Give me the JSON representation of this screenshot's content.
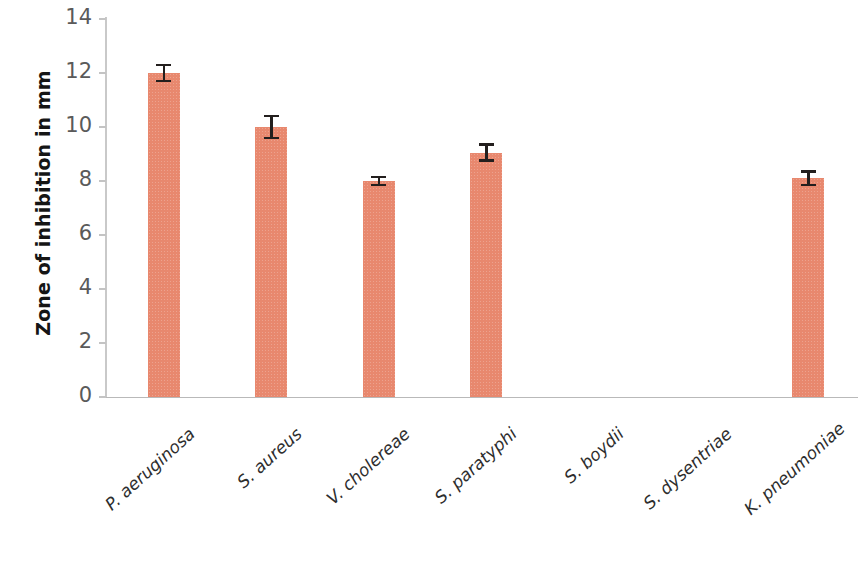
{
  "chart_data": {
    "type": "bar",
    "title": "",
    "subtitle": "",
    "xlabel": "",
    "ylabel": "Zone of inhibition in mm",
    "ylim": [
      0,
      14
    ],
    "ytick_values": [
      0,
      2,
      4,
      6,
      8,
      10,
      12,
      14
    ],
    "ytick_labels": [
      "0",
      "2",
      "4",
      "6",
      "8",
      "10",
      "12",
      "14"
    ],
    "grid": false,
    "legend": false,
    "bar_color": "#e8886e",
    "errorbar_color": "#231f1e",
    "axis_color": "#c4c4c4",
    "categories": [
      "P. aeruginosa",
      "S. aureus",
      "V. cholereae",
      "S. paratyphi",
      "S. boydii",
      "S. dysentriae",
      "K. pneumoniae"
    ],
    "values": [
      12.0,
      10.0,
      8.0,
      9.05,
      0,
      0,
      8.1
    ],
    "errors": [
      0.35,
      0.45,
      0.2,
      0.35,
      0,
      0,
      0.3
    ],
    "series": [
      {
        "name": "Zone of inhibition",
        "values": [
          12.0,
          10.0,
          8.0,
          9.05,
          0,
          0,
          8.1
        ],
        "errors": [
          0.35,
          0.45,
          0.2,
          0.35,
          0,
          0,
          0.3
        ]
      }
    ]
  }
}
